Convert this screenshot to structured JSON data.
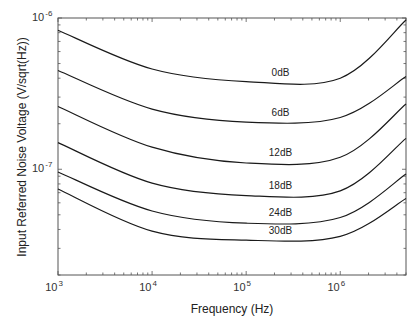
{
  "chart_data": {
    "type": "line",
    "title": "",
    "xlabel": "Frequency (Hz)",
    "ylabel": "Input Referred Noise Voltage (V/sqrt(Hz))",
    "xscale": "log",
    "yscale": "log",
    "xlim": [
      1000,
      5000000
    ],
    "ylim": [
      2e-08,
      1e-06
    ],
    "grid": false,
    "legend": "inline labels near right of curves",
    "x_ticks": [
      {
        "value": 1000,
        "base": "10",
        "exp": "3"
      },
      {
        "value": 10000,
        "base": "10",
        "exp": "4"
      },
      {
        "value": 100000,
        "base": "10",
        "exp": "5"
      },
      {
        "value": 1000000,
        "base": "10",
        "exp": "6"
      }
    ],
    "y_ticks": [
      {
        "value": 1e-06,
        "base": "10",
        "exp": "-6"
      },
      {
        "value": 1e-07,
        "base": "10",
        "exp": "-7"
      }
    ],
    "x": [
      1000,
      10000,
      100000,
      1000000,
      5000000
    ],
    "series": [
      {
        "name": "0dB",
        "values": [
          8.3e-07,
          4.6e-07,
          3.8e-07,
          4e-07,
          9.7e-07
        ]
      },
      {
        "name": "6dB",
        "values": [
          4.5e-07,
          2.5e-07,
          2.05e-07,
          2.2e-07,
          4.1e-07
        ]
      },
      {
        "name": "12dB",
        "values": [
          2.6e-07,
          1.4e-07,
          1.1e-07,
          1.2e-07,
          2.7e-07
        ]
      },
      {
        "name": "18dB",
        "values": [
          1.5e-07,
          8.1e-08,
          6.7e-08,
          7.2e-08,
          1.6e-07
        ]
      },
      {
        "name": "24dB",
        "values": [
          9.6e-08,
          5.3e-08,
          4.4e-08,
          4.8e-08,
          9.3e-08
        ]
      },
      {
        "name": "30dB",
        "values": [
          7.4e-08,
          3.9e-08,
          3.4e-08,
          3.6e-08,
          6.4e-08
        ]
      }
    ]
  },
  "style": {
    "line_color": "#1a1a1a",
    "axis_color": "#555555",
    "background": "#ffffff"
  }
}
